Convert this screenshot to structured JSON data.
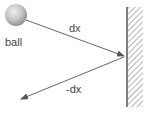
{
  "diagram": {
    "ball": {
      "label": "ball",
      "cx": 16,
      "cy": 15,
      "r": 11
    },
    "incoming_vector": {
      "label": "dx",
      "from": [
        26,
        20
      ],
      "to": [
        124,
        56
      ]
    },
    "reflected_vector": {
      "label": "-dx",
      "from": [
        124,
        56
      ],
      "to": [
        21,
        99
      ]
    },
    "wall": {
      "x": 127,
      "y_top": 7,
      "y_bottom": 107,
      "hatch_width": 16
    },
    "colors": {
      "line": "#555555",
      "ball_light": "#e6e6e6",
      "ball_dark": "#8f8f8f",
      "hatch": "#777777"
    }
  }
}
